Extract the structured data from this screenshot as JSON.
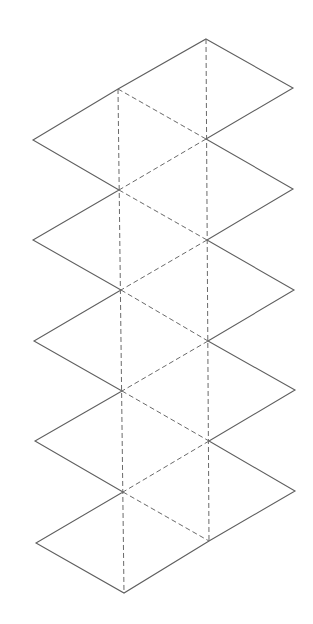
{
  "diagram": {
    "title": "Icosahedron net",
    "type": "net",
    "faces": 20,
    "colors": {
      "background": "#ffffff",
      "cut_line": "#5f5f5f",
      "fold_line": "#6a6a6a"
    },
    "line_styles": {
      "cut": "solid",
      "fold": "dashed"
    },
    "vertices": {
      "right_column": [
        [
          206,
          39
        ],
        [
          206,
          139
        ],
        [
          207,
          240
        ],
        [
          208,
          341
        ],
        [
          209,
          441
        ],
        [
          209,
          541
        ]
      ],
      "left_column": [
        [
          118,
          89
        ],
        [
          119,
          190
        ],
        [
          121,
          290
        ],
        [
          122,
          391
        ],
        [
          123,
          492
        ],
        [
          124,
          593
        ]
      ],
      "left_outer": [
        [
          33,
          140
        ],
        [
          33,
          240
        ],
        [
          34,
          341
        ],
        [
          35,
          441
        ],
        [
          36,
          543
        ]
      ],
      "right_outer": [
        [
          293,
          88
        ],
        [
          293,
          189
        ],
        [
          294,
          290
        ],
        [
          295,
          390
        ],
        [
          295,
          491
        ]
      ]
    }
  }
}
